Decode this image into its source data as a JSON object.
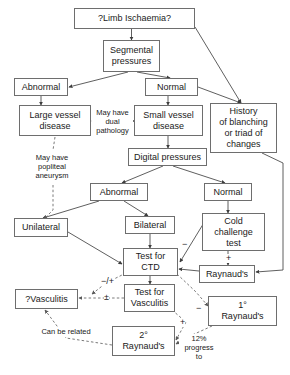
{
  "diagram": {
    "colors": {
      "box_border": "#6e6e6e",
      "line": "#4d4d4d",
      "text": "#1a1a1a",
      "background": "#ffffff"
    },
    "nodes": [
      {
        "id": "limb-ischaemia",
        "label": "?Limb Ischaemia?",
        "x": 74,
        "y": 8,
        "w": 121,
        "h": 21
      },
      {
        "id": "segmental",
        "label": "Segmental\npressures",
        "x": 103,
        "y": 40,
        "w": 57,
        "h": 32
      },
      {
        "id": "abnormal-1",
        "label": "Abnormal",
        "x": 14,
        "y": 78,
        "w": 54,
        "h": 18
      },
      {
        "id": "normal-1",
        "label": "Normal",
        "x": 145,
        "y": 78,
        "w": 53,
        "h": 18
      },
      {
        "id": "large-vessel",
        "label": "Large vessel\ndisease",
        "x": 19,
        "y": 105,
        "w": 72,
        "h": 31
      },
      {
        "id": "small-vessel",
        "label": "Small vessel\ndisease",
        "x": 134,
        "y": 105,
        "w": 69,
        "h": 31
      },
      {
        "id": "history",
        "label": "History\nof blanching\nor triad of\nchanges",
        "x": 210,
        "y": 103,
        "w": 67,
        "h": 50
      },
      {
        "id": "digital",
        "label": "Digital pressures",
        "x": 128,
        "y": 148,
        "w": 79,
        "h": 18
      },
      {
        "id": "abnormal-2",
        "label": "Abnormal",
        "x": 90,
        "y": 183,
        "w": 58,
        "h": 18
      },
      {
        "id": "normal-2",
        "label": "Normal",
        "x": 204,
        "y": 183,
        "w": 48,
        "h": 18
      },
      {
        "id": "unilateral",
        "label": "Unilateral",
        "x": 14,
        "y": 218,
        "w": 54,
        "h": 19
      },
      {
        "id": "bilateral",
        "label": "Bilateral",
        "x": 125,
        "y": 216,
        "w": 50,
        "h": 18
      },
      {
        "id": "cold-challenge",
        "label": "Cold\nchallenge\ntest",
        "x": 202,
        "y": 213,
        "w": 63,
        "h": 38
      },
      {
        "id": "test-ctd",
        "label": "Test for\nCTD",
        "x": 123,
        "y": 248,
        "w": 55,
        "h": 28
      },
      {
        "id": "raynauds",
        "label": "Raynaud's",
        "x": 199,
        "y": 265,
        "w": 56,
        "h": 18
      },
      {
        "id": "test-vasculitis",
        "label": "Test for\nVasculitis",
        "x": 124,
        "y": 284,
        "w": 51,
        "h": 28
      },
      {
        "id": "vasculitis-q",
        "label": "?Vasculitis",
        "x": 15,
        "y": 289,
        "w": 63,
        "h": 20
      },
      {
        "id": "primary-raynauds",
        "label": "1°\nRaynaud's",
        "x": 208,
        "y": 296,
        "w": 69,
        "h": 30
      },
      {
        "id": "secondary-raynauds",
        "label": "2°\nRaynaud's",
        "x": 112,
        "y": 326,
        "w": 63,
        "h": 30
      }
    ],
    "notes": [
      {
        "id": "dual-pathology",
        "label": "May have\ndual\npathology",
        "x": 92,
        "y": 108,
        "w": 41,
        "h": 28
      },
      {
        "id": "popliteal-aneurysm",
        "label": "May have\npopliteal\naneurysm",
        "x": 26,
        "y": 153,
        "w": 52,
        "h": 30
      },
      {
        "id": "can-be-related",
        "label": "Can be related",
        "x": 33,
        "y": 327,
        "w": 66,
        "h": 10
      },
      {
        "id": "progress-to",
        "label": "12%\nprogress\nto",
        "x": 179,
        "y": 334,
        "w": 40,
        "h": 30
      }
    ],
    "signs": [
      {
        "id": "sign-cold-minus",
        "label": "−",
        "x": 182,
        "y": 240
      },
      {
        "id": "sign-cold-plus",
        "label": "+",
        "x": 226,
        "y": 254
      },
      {
        "id": "sign-ctd-minus-plus",
        "label": "−/+",
        "x": 101,
        "y": 277
      },
      {
        "id": "sign-vasculitis-pm",
        "label": "±",
        "x": 104,
        "y": 293
      },
      {
        "id": "sign-primary-minus",
        "label": "−",
        "x": 196,
        "y": 304
      },
      {
        "id": "sign-secondary-plus",
        "label": "+",
        "x": 180,
        "y": 318
      }
    ]
  }
}
